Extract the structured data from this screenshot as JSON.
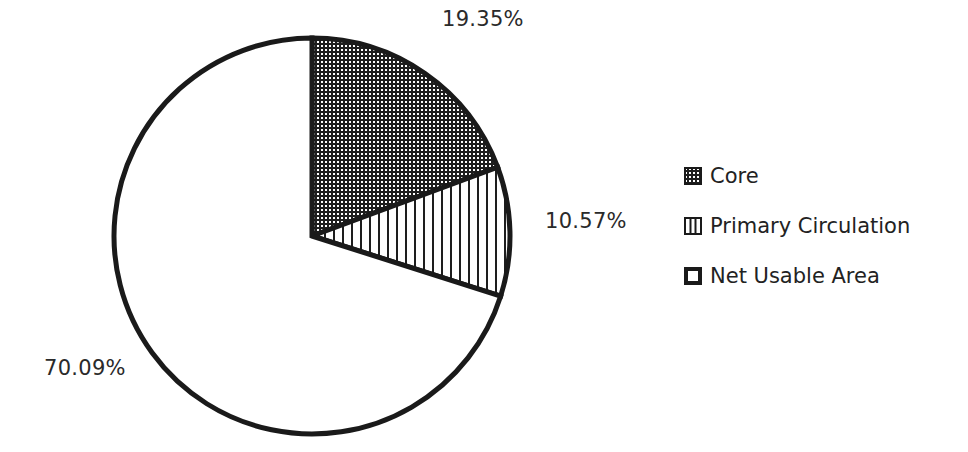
{
  "chart_data": {
    "type": "pie",
    "title": "",
    "slices": [
      {
        "label": "Core",
        "value": 19.35,
        "display": "19.35%",
        "pattern": "dotted-grid"
      },
      {
        "label": "Primary Circulation",
        "value": 10.57,
        "display": "10.57%",
        "pattern": "vertical-lines"
      },
      {
        "label": "Net Usable Area",
        "value": 70.09,
        "display": "70.09%",
        "pattern": "none"
      }
    ],
    "start_angle": "12 o'clock",
    "direction": "clockwise",
    "legend": {
      "position": "right",
      "entries": [
        "Core",
        "Primary Circulation",
        "Net Usable Area"
      ]
    }
  },
  "labels": {
    "core_pct": "19.35%",
    "circulation_pct": "10.57%",
    "net_pct": "70.09%"
  },
  "legend": {
    "core": "Core",
    "circulation": "Primary Circulation",
    "net": "Net Usable Area"
  },
  "colors": {
    "stroke": "#1a1a1a",
    "background": "#ffffff"
  }
}
